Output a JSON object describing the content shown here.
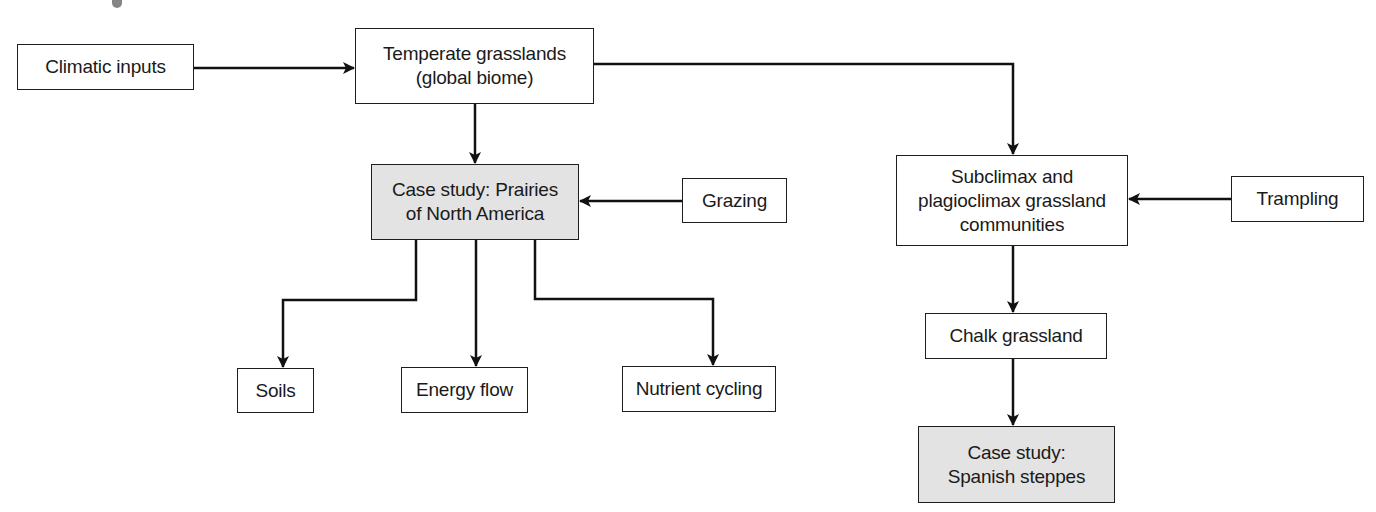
{
  "diagram": {
    "type": "flowchart",
    "nodes": [
      {
        "id": "climatic",
        "label": "Climatic inputs",
        "shaded": false
      },
      {
        "id": "temperate",
        "label": "Temperate grasslands\n(global biome)",
        "shaded": false
      },
      {
        "id": "prairies",
        "label": "Case study: Prairies\nof North America",
        "shaded": true
      },
      {
        "id": "grazing",
        "label": "Grazing",
        "shaded": false
      },
      {
        "id": "subclimax",
        "label": "Subclimax and\nplagioclimax grassland\ncommunities",
        "shaded": false
      },
      {
        "id": "trampling",
        "label": "Trampling",
        "shaded": false
      },
      {
        "id": "soils",
        "label": "Soils",
        "shaded": false
      },
      {
        "id": "energy",
        "label": "Energy flow",
        "shaded": false
      },
      {
        "id": "nutrient",
        "label": "Nutrient cycling",
        "shaded": false
      },
      {
        "id": "chalk",
        "label": "Chalk grassland",
        "shaded": false
      },
      {
        "id": "steppes",
        "label": "Case study:\nSpanish steppes",
        "shaded": true
      }
    ],
    "edges": [
      {
        "from": "climatic",
        "to": "temperate"
      },
      {
        "from": "temperate",
        "to": "prairies"
      },
      {
        "from": "temperate",
        "to": "subclimax"
      },
      {
        "from": "grazing",
        "to": "prairies"
      },
      {
        "from": "trampling",
        "to": "subclimax"
      },
      {
        "from": "prairies",
        "to": "soils"
      },
      {
        "from": "prairies",
        "to": "energy"
      },
      {
        "from": "prairies",
        "to": "nutrient"
      },
      {
        "from": "subclimax",
        "to": "chalk"
      },
      {
        "from": "chalk",
        "to": "steppes"
      }
    ],
    "colors": {
      "line": "#111111",
      "box_border": "#1e1e1e",
      "shaded_fill": "#e3e3e3",
      "fill": "#ffffff"
    }
  }
}
